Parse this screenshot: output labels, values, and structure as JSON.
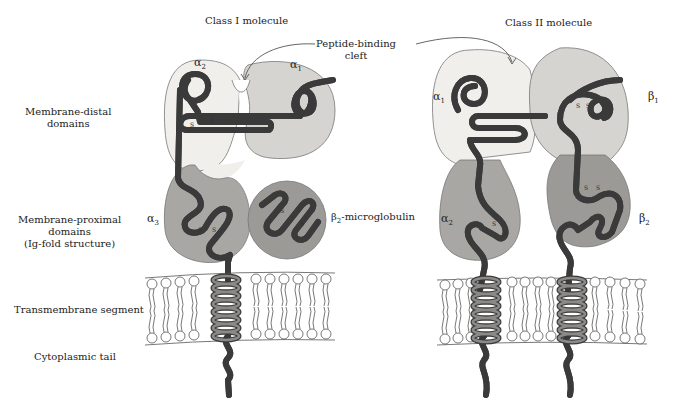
{
  "titles": {
    "class1": "Class I molecule",
    "class2": "Class II molecule"
  },
  "callout": {
    "line1": "Peptide-binding",
    "line2": "cleft"
  },
  "row_labels": {
    "distal_1": "Membrane-distal",
    "distal_2": "domains",
    "proximal_1": "Membrane-proximal",
    "proximal_2": "domains",
    "proximal_3": "(Ig-fold structure)",
    "transmembrane": "Transmembrane segment",
    "cytoplasmic": "Cytoplasmic tail"
  },
  "class1_domains": {
    "alpha1": {
      "sym": "α",
      "sub": "1"
    },
    "alpha2": {
      "sym": "α",
      "sub": "2"
    },
    "alpha3": {
      "sym": "α",
      "sub": "3"
    },
    "b2m": {
      "sym": "β",
      "sub": "2",
      "suffix": "-microglobulin"
    }
  },
  "class2_domains": {
    "alpha1": {
      "sym": "α",
      "sub": "1"
    },
    "beta1": {
      "sym": "β",
      "sub": "1"
    },
    "alpha2": {
      "sym": "α",
      "sub": "2"
    },
    "beta2": {
      "sym": "β",
      "sub": "2"
    }
  },
  "disulfide_label": "S",
  "colors": {
    "light_domain": "#f0efec",
    "mid_domain": "#d6d4d0",
    "dark_domain": "#a9a7a4",
    "darker_domain": "#9c9a97",
    "chain_fill": "#8c8a88",
    "chain_outline": "#3a3a3a",
    "membrane_line": "#555555"
  }
}
